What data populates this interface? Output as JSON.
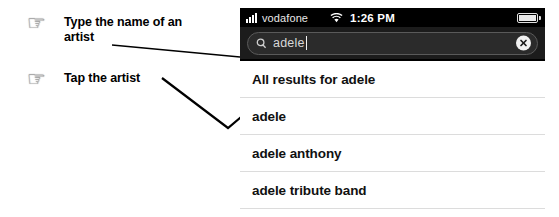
{
  "annotations": [
    {
      "icon": "pointing-hand-icon",
      "glyph": "☞",
      "text": "Type the name of an artist"
    },
    {
      "icon": "pointing-hand-icon",
      "glyph": "☞",
      "text": "Tap the artist"
    }
  ],
  "phone": {
    "status_bar": {
      "signal_icon": "signal-bars-icon",
      "carrier": "vodafone",
      "wifi_icon": "wifi-icon",
      "time": "1:26 PM",
      "battery_icon": "battery-icon"
    },
    "search": {
      "search_icon": "magnifier-icon",
      "value": "adele",
      "clear_icon": "clear-circle-x-icon"
    },
    "results": [
      {
        "label": "All results for adele"
      },
      {
        "label": "adele"
      },
      {
        "label": "adele anthony"
      },
      {
        "label": "adele tribute band"
      }
    ]
  },
  "colors": {
    "status_bar_bg": "#000000",
    "search_bar_bg": "#1c1c1c",
    "list_bg": "#ffffff",
    "separator": "#dcdcdc",
    "hand": "#a8a8a8"
  }
}
